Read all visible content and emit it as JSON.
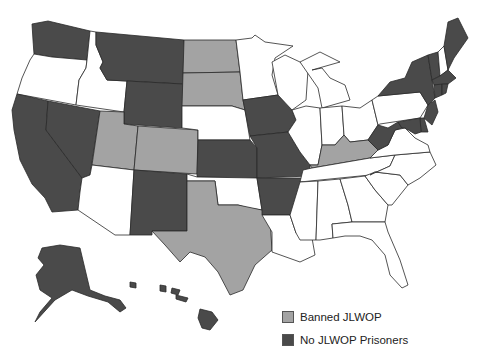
{
  "colors": {
    "banned": "#a3a3a3",
    "no_prisoners": "#4a4a4a",
    "other": "#ffffff",
    "border": "#2a2a2a"
  },
  "legend": [
    {
      "key": "banned",
      "label": "Banned JLWOP",
      "color": "#a3a3a3"
    },
    {
      "key": "no_prisoners",
      "label": "No JLWOP Prisoners",
      "color": "#4a4a4a"
    }
  ],
  "states": {
    "banned": [
      "ND",
      "SD",
      "UT",
      "CO",
      "TX",
      "KY"
    ],
    "no_prisoners": [
      "WA",
      "MT",
      "WY",
      "CA",
      "NV",
      "NM",
      "KS",
      "IA",
      "MO",
      "AR",
      "WV",
      "NY",
      "VT",
      "ME",
      "MA",
      "CT",
      "RI",
      "NJ",
      "DE",
      "MD",
      "AK",
      "HI"
    ],
    "other": [
      "OR",
      "ID",
      "AZ",
      "NE",
      "OK",
      "MN",
      "WI",
      "IL",
      "MI",
      "IN",
      "OH",
      "PA",
      "NH",
      "VA",
      "NC",
      "SC",
      "TN",
      "GA",
      "AL",
      "MS",
      "LA",
      "FL"
    ]
  }
}
